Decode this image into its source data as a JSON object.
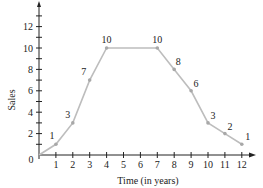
{
  "chart_data": {
    "type": "line",
    "title": "",
    "xlabel": "Time (in years)",
    "ylabel": "Sales",
    "x": [
      0,
      1,
      2,
      3,
      4,
      7,
      8,
      9,
      10,
      11,
      12
    ],
    "values": [
      0,
      1,
      3,
      7,
      10,
      10,
      8,
      6,
      3,
      2,
      1
    ],
    "point_labels": [
      {
        "x": 1,
        "y": 1,
        "label": "1"
      },
      {
        "x": 2,
        "y": 3,
        "label": "3"
      },
      {
        "x": 3,
        "y": 7,
        "label": "7"
      },
      {
        "x": 4,
        "y": 10,
        "label": "10"
      },
      {
        "x": 7,
        "y": 10,
        "label": "10"
      },
      {
        "x": 8,
        "y": 8,
        "label": "8"
      },
      {
        "x": 9,
        "y": 6,
        "label": "6"
      },
      {
        "x": 10,
        "y": 3,
        "label": "3"
      },
      {
        "x": 11,
        "y": 2,
        "label": "2"
      },
      {
        "x": 12,
        "y": 1,
        "label": "1"
      }
    ],
    "x_ticks": [
      "1",
      "2",
      "3",
      "4",
      "5",
      "6",
      "7",
      "8",
      "9",
      "10",
      "11",
      "12"
    ],
    "y_ticks": [
      "2",
      "4",
      "6",
      "8",
      "10",
      "12"
    ],
    "origin_label": "0",
    "xlim": [
      0,
      13
    ],
    "ylim": [
      0,
      14
    ],
    "grid": false,
    "legend": null,
    "line_color": "#bdbdbd",
    "axis_color": "#222222"
  }
}
